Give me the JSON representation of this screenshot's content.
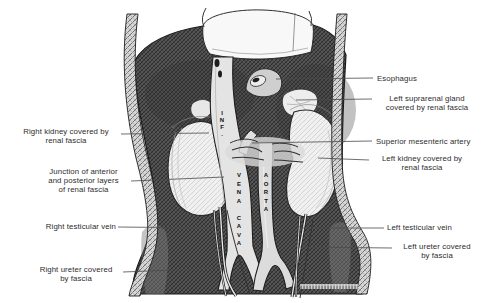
{
  "figure": {
    "type": "anatomical pen-and-ink illustration",
    "colors": {
      "ink": "#1a1a1a",
      "paper": "#ffffff",
      "cavity_shading": "#4a4a4a",
      "body_wall_shading": "#d6d6d6",
      "organ_fill": "#efefef",
      "vessel_fill": "#e4e4e4",
      "label_text": "#2d2d2d",
      "leader_line": "#4a4a4a"
    }
  },
  "labels": {
    "right_kidney": "Right kidney covered by\nrenal fascia",
    "junction": "Junction of anterior\nand posterior layers\nof renal fascia",
    "right_testicular_vein": "Right testicular vein",
    "right_ureter": "Right ureter covered\nby fascia",
    "esophagus": "Esophagus",
    "left_suprarenal": "Left suprarenal gland\ncovered by renal fascia",
    "superior_mesenteric_artery": "Superior mesenteric artery",
    "left_kidney": "Left kidney covered by\nrenal fascia",
    "left_testicular_vein": "Left testicular vein",
    "left_ureter": "Left ureter covered\nby fascia"
  },
  "vessel_labels": {
    "inferior_vena_cava_upper": "INF.",
    "inferior_vena_cava_lower": "VENA CAVA",
    "aorta": "AORTA"
  }
}
